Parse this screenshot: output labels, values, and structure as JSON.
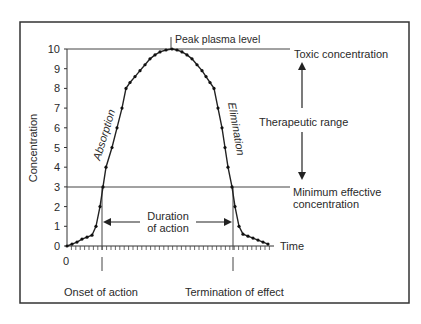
{
  "chart_data": {
    "type": "line",
    "title": "",
    "xlabel": "Time",
    "ylabel": "Concentration",
    "ylim": [
      0,
      10
    ],
    "yticks": [
      0,
      1,
      2,
      3,
      4,
      5,
      6,
      7,
      8,
      9,
      10
    ],
    "xtick_labels": [
      "0"
    ],
    "grid": false,
    "series": [
      {
        "name": "Plasma concentration",
        "x": [
          0,
          5,
          10,
          15,
          20,
          25,
          29,
          33,
          36,
          39,
          45,
          50,
          55,
          59,
          63,
          68,
          73,
          78,
          83,
          88,
          93,
          99,
          105,
          110,
          115,
          120,
          125,
          130,
          135,
          139,
          143,
          147,
          151,
          155,
          158,
          161,
          165,
          168,
          172,
          176,
          181,
          186,
          191,
          196,
          201
        ],
        "values": [
          0,
          0.1,
          0.2,
          0.35,
          0.45,
          0.55,
          1,
          2,
          3,
          4,
          5,
          6,
          7,
          8,
          8.3,
          8.6,
          8.9,
          9.2,
          9.5,
          9.7,
          9.85,
          9.95,
          10,
          9.95,
          9.85,
          9.7,
          9.5,
          9.2,
          8.9,
          8.6,
          8.3,
          8,
          7,
          6,
          5,
          4,
          3,
          2,
          1,
          0.6,
          0.5,
          0.4,
          0.3,
          0.2,
          0.1
        ]
      }
    ],
    "reference_lines": [
      {
        "name": "Toxic concentration",
        "y": 10
      },
      {
        "name": "Minimum effective concentration",
        "y": 3
      }
    ],
    "annotations": {
      "peak": "Peak plasma level",
      "toxic": "Toxic concentration",
      "therapeutic": "Therapeutic range",
      "min_effective_line1": "Minimum effective",
      "min_effective_line2": "concentration",
      "absorption": "Absorption",
      "elimination": "Elimination",
      "duration_line1": "Duration",
      "duration_line2": "of action",
      "onset": "Onset of action",
      "termination": "Termination of effect",
      "time": "Time",
      "x_zero": "0"
    }
  }
}
